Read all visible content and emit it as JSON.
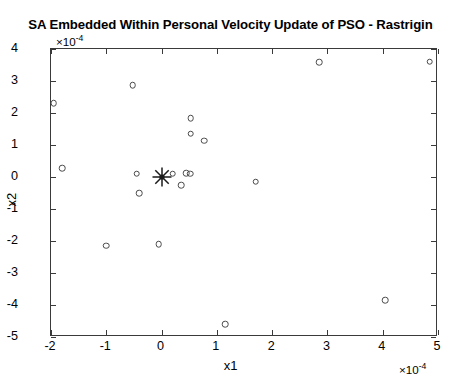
{
  "figure": {
    "title": "SA Embedded Within Personal Velocity Update of PSO - Rastrigin",
    "x_axis_label": "x1",
    "y_axis_label": "x2",
    "x_multiplier": "×10",
    "x_multiplier_exp": "-4",
    "y_multiplier": "×10",
    "y_multiplier_exp": "-4",
    "marker_color": "#4a4a4a",
    "axis_color": "#3a3a3a",
    "background": "#ffffff"
  },
  "chart_data": {
    "type": "scatter",
    "title": "SA Embedded Within Personal Velocity Update of PSO - Rastrigin",
    "xlabel": "x1",
    "ylabel": "x2",
    "x_scale_factor": 0.0001,
    "y_scale_factor": 0.0001,
    "xlim": [
      -2,
      5
    ],
    "ylim": [
      -5,
      4
    ],
    "xticks": [
      -2,
      -1,
      0,
      1,
      2,
      3,
      4,
      5
    ],
    "xticklabels": [
      "-2",
      "-1",
      "0",
      "1",
      "2",
      "3",
      "4",
      "5"
    ],
    "yticks": [
      -5,
      -4,
      -3,
      -2,
      -1,
      0,
      1,
      2,
      3,
      4
    ],
    "yticklabels": [
      "-5",
      "-4",
      "-3",
      "-2",
      "-1",
      "0",
      "1",
      "2",
      "3",
      "4"
    ],
    "grid": false,
    "legend": null,
    "series": [
      {
        "name": "particles",
        "marker": "circle-open",
        "color": "#4a4a4a",
        "points": [
          {
            "x": -1.95,
            "y": 2.3
          },
          {
            "x": -1.8,
            "y": 0.28
          },
          {
            "x": -0.52,
            "y": 2.87
          },
          {
            "x": -1.0,
            "y": -2.15
          },
          {
            "x": -0.45,
            "y": 0.1
          },
          {
            "x": -0.4,
            "y": -0.5
          },
          {
            "x": -0.05,
            "y": -2.1
          },
          {
            "x": 0.2,
            "y": 0.1
          },
          {
            "x": 0.45,
            "y": 0.12
          },
          {
            "x": 0.52,
            "y": 0.1
          },
          {
            "x": 0.35,
            "y": -0.25
          },
          {
            "x": 0.53,
            "y": 1.84
          },
          {
            "x": 0.53,
            "y": 1.35
          },
          {
            "x": 0.77,
            "y": 1.13
          },
          {
            "x": 1.15,
            "y": -4.6
          },
          {
            "x": 1.7,
            "y": -0.15
          },
          {
            "x": 2.85,
            "y": 3.58
          },
          {
            "x": 4.05,
            "y": -3.85
          },
          {
            "x": 4.85,
            "y": 3.6
          }
        ]
      },
      {
        "name": "global-best",
        "marker": "star",
        "color": "#1a1a1a",
        "points": [
          {
            "x": 0.0,
            "y": 0.0
          }
        ]
      }
    ]
  }
}
